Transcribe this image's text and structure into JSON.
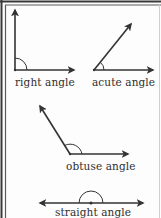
{
  "diagram": {
    "colors": {
      "stroke": "#333333",
      "frame_outer": "#3a3a3a",
      "frame_inner": "#555555",
      "frame_right": "#c8c8c8",
      "background": "#fdfdfd"
    },
    "angles": [
      {
        "id": "right",
        "label": "right angle",
        "degrees": 90
      },
      {
        "id": "acute",
        "label": "acute angle",
        "degrees": 50
      },
      {
        "id": "obtuse",
        "label": "obtuse angle",
        "degrees": 123
      },
      {
        "id": "straight",
        "label": "straight angle",
        "degrees": 180
      }
    ]
  }
}
